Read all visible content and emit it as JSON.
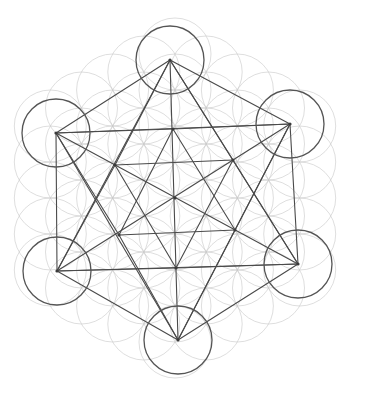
{
  "drawing": {
    "subject": "Metatron's Cube over Flower of Life",
    "medium": "pencil sketch",
    "colors": {
      "background": "#ffffff",
      "grid_circles": "#c8c8c8",
      "main_lines": "#4a4a4a",
      "node_circles": "#555555"
    },
    "center": [
      175,
      198
    ],
    "node_radius": 34,
    "grid_radius": 36,
    "outer_vertices": [
      {
        "name": "top",
        "x": 170,
        "y": 60
      },
      {
        "name": "upper-right",
        "x": 290,
        "y": 124
      },
      {
        "name": "lower-right",
        "x": 298,
        "y": 264
      },
      {
        "name": "bottom",
        "x": 178,
        "y": 340
      },
      {
        "name": "lower-left",
        "x": 57,
        "y": 271
      },
      {
        "name": "upper-left",
        "x": 56,
        "y": 133
      }
    ],
    "inner_vertices": [
      {
        "name": "inner-top",
        "x": 173,
        "y": 129
      },
      {
        "name": "inner-upper-right",
        "x": 233,
        "y": 160
      },
      {
        "name": "inner-lower-right",
        "x": 235,
        "y": 230
      },
      {
        "name": "inner-bottom",
        "x": 176,
        "y": 268
      },
      {
        "name": "inner-lower-left",
        "x": 119,
        "y": 235
      },
      {
        "name": "inner-upper-left",
        "x": 115,
        "y": 165
      }
    ]
  }
}
